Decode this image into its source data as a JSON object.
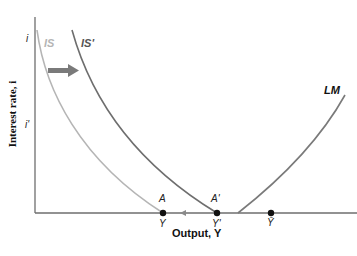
{
  "diagram": {
    "y_axis_label": "Interest rate, i",
    "x_axis_label": "Output, Y",
    "y_ticks": {
      "i": "i",
      "i_prime": "i'"
    },
    "curves": {
      "is": {
        "label": "IS",
        "color": "#b5b5b5"
      },
      "is_prime": {
        "label": "IS'",
        "color": "#6e6e6e"
      },
      "lm": {
        "label": "LM",
        "color": "#7a7a7a"
      }
    },
    "points": {
      "a": {
        "label": "A",
        "x_label": "Y"
      },
      "a_prime": {
        "label": "A'",
        "x_label": "Y'"
      },
      "y_bar": {
        "label": "",
        "x_label": "Ȳ"
      }
    },
    "shift_arrow_color": "#7a7a7a",
    "axis_color": "#6e6e6e"
  }
}
